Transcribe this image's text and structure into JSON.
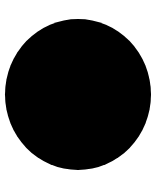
{
  "canvas": {
    "background_color": "#ffffff",
    "width": 165,
    "height": 182
  },
  "shape": {
    "type": "circle",
    "fill_color": "#000000",
    "left": 5,
    "top": 19,
    "width": 146,
    "height": 151
  }
}
